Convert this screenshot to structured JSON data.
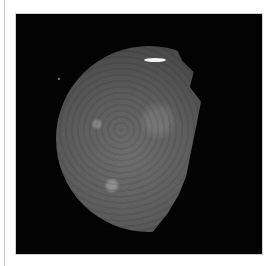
{
  "image": {
    "subject": "moon photograph",
    "description": "Partially lit cratered moon against black space, shown inside a white-bordered frame",
    "background_color": "#030303",
    "frame_color": "#ffffff",
    "moon_color": "#5c5c5c"
  }
}
